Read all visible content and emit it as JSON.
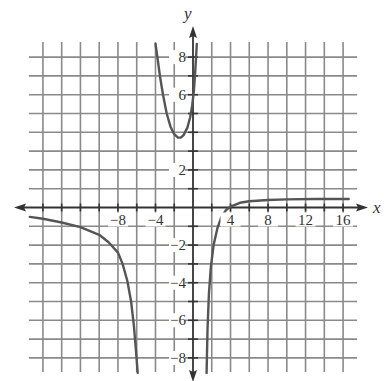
{
  "chart_data": {
    "type": "line",
    "title": "",
    "xlabel": "x",
    "ylabel": "y",
    "xlim": [
      -18,
      18
    ],
    "ylim": [
      -9,
      9
    ],
    "grid": true,
    "legend": null,
    "x_grid_step": 2,
    "y_grid_step": 1,
    "grid_x_range": [
      -16,
      16
    ],
    "grid_y_range": [
      -8,
      8
    ],
    "x_ticks": [
      -8,
      -4,
      4,
      8,
      12,
      16
    ],
    "x_tick_labels": [
      "−8",
      "−4",
      "4",
      "8",
      "12",
      "16"
    ],
    "y_ticks": [
      -8,
      -6,
      -4,
      -2,
      2,
      6,
      8
    ],
    "y_tick_labels": [
      "−8",
      "−6",
      "−4",
      "−2",
      "2",
      "6",
      "8"
    ],
    "asymptotes": {
      "vertical": [
        -6,
        0.5,
        1.5
      ],
      "horizontal": [
        0.5
      ]
    },
    "series": [
      {
        "name": "left-branch",
        "x": [
          -17.4,
          -16,
          -14,
          -12,
          -10,
          -9,
          -8,
          -7.5,
          -7,
          -6.6,
          -6.3,
          -6.1,
          -5.9
        ],
        "y": [
          -0.5,
          -0.6,
          -0.8,
          -1.05,
          -1.45,
          -1.85,
          -2.4,
          -3.0,
          -3.9,
          -5.0,
          -6.3,
          -7.5,
          -8.8
        ]
      },
      {
        "name": "middle-branch",
        "x": [
          -4.0,
          -3.8,
          -3.5,
          -3.2,
          -2.8,
          -2.4,
          -2.0,
          -1.6,
          -1.3,
          -1.0,
          -0.6,
          -0.3,
          -0.1,
          0.1,
          0.25,
          0.4
        ],
        "y": [
          8.7,
          8.0,
          6.9,
          6.0,
          5.0,
          4.3,
          3.9,
          3.72,
          3.72,
          3.85,
          4.25,
          4.8,
          5.4,
          6.2,
          7.3,
          8.7
        ]
      },
      {
        "name": "right-branch",
        "x": [
          1.45,
          1.55,
          1.7,
          1.9,
          2.2,
          2.6,
          3.0,
          3.5,
          4.0,
          5.0,
          6.0,
          8.0,
          10.0,
          13.0,
          16.6
        ],
        "y": [
          -8.8,
          -6.5,
          -4.6,
          -3.2,
          -2.0,
          -1.1,
          -0.55,
          -0.15,
          0.05,
          0.25,
          0.33,
          0.4,
          0.43,
          0.45,
          0.45
        ]
      }
    ]
  },
  "labels": {
    "x_axis": "x",
    "y_axis": "y"
  },
  "colors": {
    "grid": "#8a8a8a",
    "axis": "#333333",
    "curve": "#555555",
    "text": "#333333"
  }
}
